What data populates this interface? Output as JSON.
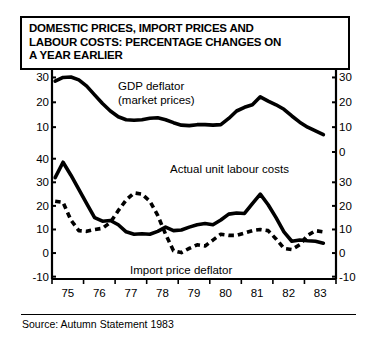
{
  "title": {
    "line1": "DOMESTIC PRICES, IMPORT PRICES AND",
    "line2": "LABOUR COSTS: PERCENTAGE CHANGES ON",
    "line3": "A YEAR EARLIER"
  },
  "source": {
    "text": "Source: Autumn Statement 1983"
  },
  "colors": {
    "ink": "#000000",
    "background": "#ffffff"
  },
  "labels": {
    "gdp_deflator_line1": "GDP deflator",
    "gdp_deflator_line2": "(market prices)",
    "unit_labour_costs": "Actual unit labour costs",
    "import_price_deflator": "Import price deflator"
  },
  "chart_data": {
    "type": "line",
    "title": "DOMESTIC PRICES, IMPORT PRICES AND LABOUR COSTS: PERCENTAGE CHANGES ON A YEAR EARLIER",
    "xlabel": "",
    "ylabel": "",
    "grid": false,
    "legend": "inline-annotations",
    "xlim": [
      1974.5,
      1983.5
    ],
    "x_tick_labels": [
      "75",
      "76",
      "77",
      "78",
      "79",
      "80",
      "81",
      "82",
      "83"
    ],
    "x_tick_values": [
      1975,
      1976,
      1977,
      1978,
      1979,
      1980,
      1981,
      1982,
      1983
    ],
    "panels": [
      {
        "name": "upper",
        "ylim": [
          0,
          33
        ],
        "y_ticks_left": [
          10,
          20,
          30
        ],
        "y_tick_labels_left": [
          "10",
          "20",
          "30"
        ],
        "y_ticks_right": [
          0,
          10,
          20,
          30
        ],
        "y_tick_labels_right": [
          "0",
          "10",
          "20",
          "30"
        ],
        "series": [
          {
            "name": "GDP deflator (market prices)",
            "style": "solid",
            "x": [
              1974.6,
              1974.85,
              1975.1,
              1975.35,
              1975.6,
              1975.85,
              1976.1,
              1976.35,
              1976.6,
              1976.85,
              1977.1,
              1977.35,
              1977.6,
              1977.85,
              1978.1,
              1978.35,
              1978.6,
              1978.85,
              1979.1,
              1979.35,
              1979.6,
              1979.85,
              1980.1,
              1980.35,
              1980.6,
              1980.85,
              1981.1,
              1981.35,
              1981.6,
              1981.85,
              1982.1,
              1982.35,
              1982.6,
              1982.85,
              1983.1
            ],
            "values": [
              28.5,
              30.0,
              30.2,
              29.0,
              26.5,
              23.0,
              19.5,
              16.5,
              14.2,
              13.0,
              12.8,
              13.0,
              13.6,
              13.8,
              13.0,
              11.8,
              10.8,
              10.6,
              11.0,
              11.0,
              10.8,
              11.0,
              13.5,
              16.5,
              18.0,
              19.0,
              22.2,
              20.5,
              19.0,
              17.2,
              14.5,
              12.0,
              10.0,
              8.5,
              7.0,
              6.0,
              5.5
            ],
            "note": "peaks near 30 in 1975, trough near 10.6 in 1979, secondary peak 22 in 1981, declining to ~5 by 1983"
          }
        ]
      },
      {
        "name": "lower",
        "ylim": [
          -11,
          42
        ],
        "y_ticks_left": [
          -10,
          0,
          10,
          20,
          30,
          40
        ],
        "y_tick_labels_left": [
          "-10",
          "0",
          "10",
          "20",
          "30",
          "40"
        ],
        "y_ticks_right": [
          -10,
          0,
          10,
          20,
          30
        ],
        "y_tick_labels_right": [
          "-10",
          "0",
          "10",
          "20",
          "30"
        ],
        "series": [
          {
            "name": "Actual unit labour costs",
            "style": "solid",
            "x": [
              1974.6,
              1974.85,
              1975.1,
              1975.35,
              1975.6,
              1975.85,
              1976.1,
              1976.35,
              1976.6,
              1976.85,
              1977.1,
              1977.35,
              1977.6,
              1977.85,
              1978.1,
              1978.35,
              1978.6,
              1978.85,
              1979.1,
              1979.35,
              1979.6,
              1979.85,
              1980.1,
              1980.35,
              1980.6,
              1980.85,
              1981.1,
              1981.35,
              1981.6,
              1981.85,
              1982.1,
              1982.35,
              1982.6,
              1982.85,
              1983.1
            ],
            "values": [
              32.0,
              38.5,
              33.0,
              27.0,
              21.0,
              15.0,
              13.5,
              13.8,
              12.0,
              9.0,
              8.0,
              8.2,
              8.0,
              9.2,
              11.0,
              9.5,
              9.8,
              11.0,
              12.0,
              12.5,
              12.0,
              14.0,
              16.5,
              17.0,
              16.8,
              21.0,
              25.0,
              20.5,
              15.0,
              9.0,
              5.0,
              5.5,
              5.2,
              5.0,
              4.2,
              3.0,
              3.2
            ],
            "note": "spike 38.5 in 1975, trough ~8 in 1977, secondary peak 25 in 1980, falls to ~3 by 1983"
          },
          {
            "name": "Import price deflator",
            "style": "dashed",
            "x": [
              1974.6,
              1974.85,
              1975.1,
              1975.35,
              1975.6,
              1975.85,
              1976.1,
              1976.35,
              1976.6,
              1976.85,
              1977.1,
              1977.35,
              1977.6,
              1977.85,
              1978.1,
              1978.35,
              1978.6,
              1978.85,
              1979.1,
              1979.35,
              1979.6,
              1979.85,
              1980.1,
              1980.35,
              1980.6,
              1980.85,
              1981.1,
              1981.35,
              1981.6,
              1981.85,
              1982.1,
              1982.35,
              1982.6,
              1982.85,
              1983.1
            ],
            "values": [
              22.0,
              21.5,
              14.0,
              9.5,
              9.2,
              10.0,
              10.5,
              13.0,
              18.0,
              22.5,
              25.5,
              25.0,
              22.0,
              16.0,
              8.0,
              1.0,
              0.2,
              2.0,
              3.5,
              3.0,
              5.5,
              8.0,
              7.5,
              7.5,
              8.5,
              9.5,
              10.0,
              9.5,
              6.0,
              2.0,
              1.5,
              3.5,
              7.5,
              9.5,
              9.0,
              7.0,
              9.0
            ],
            "note": "starts 22, dip to ~9 in 1975, peak 25.5 in 1977, trough near 0 in 1978, ~9 by 1983"
          }
        ]
      }
    ]
  }
}
